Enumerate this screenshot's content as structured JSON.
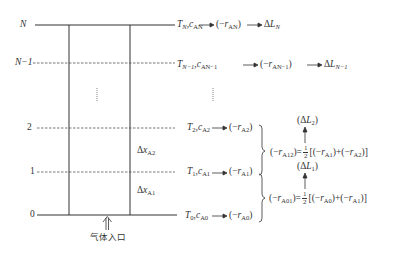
{
  "diagram": {
    "type": "reactor-segmentation-scheme",
    "levels": [
      {
        "id": "N",
        "label": "N",
        "line": "solid",
        "state": "T_N, c_AN",
        "rate": "(−r_AN)",
        "result": "ΔL_N"
      },
      {
        "id": "N-1",
        "label": "N−1",
        "line": "dashed",
        "state": "T_{N−1}, c_{AN−1}",
        "rate": "(−r_{AN−1})",
        "result": "ΔL_{N−1}"
      },
      {
        "id": "2",
        "label": "2",
        "line": "dashed",
        "state": "T_2, c_A2",
        "rate": "(−r_A2)"
      },
      {
        "id": "1",
        "label": "1",
        "line": "dashed",
        "state": "T_1, c_A1",
        "rate": "(−r_A1)"
      },
      {
        "id": "0",
        "label": "0",
        "line": "solid",
        "state": "T_0, c_A0",
        "rate": "(−r_A0)"
      }
    ],
    "segments": [
      {
        "label": "Δx_A2",
        "between": [
          "1",
          "2"
        ]
      },
      {
        "label": "Δx_A1",
        "between": [
          "0",
          "1"
        ]
      }
    ],
    "averages": [
      {
        "lhs": "(−r_A12)",
        "rhs": "½[(−r_A1)+(−r_A2)]",
        "result": "(ΔL_2)"
      },
      {
        "lhs": "(−r_A01)",
        "rhs": "½[(−r_A0)+(−r_A1)]",
        "result": "(ΔL_1)"
      }
    ],
    "inlet_label": "气体入口"
  },
  "text": {
    "lvl_N": "N",
    "lvl_N1": "N−1",
    "lvl_2": "2",
    "lvl_1": "1",
    "lvl_0": "0",
    "T": "T",
    "c": "c",
    "r": "r",
    "L": "L",
    "sub_N": "N",
    "sub_AN": "AN",
    "sub_N1": "N−1",
    "sub_AN1": "AN−1",
    "sub_2": "2",
    "sub_A2": "A2",
    "sub_1": "1",
    "sub_A1": "A1",
    "sub_0": "0",
    "sub_A0": "A0",
    "sub_A12": "A12",
    "sub_A01": "A01",
    "delta": "Δ",
    "x": "x",
    "half_num": "1",
    "half_den": "2",
    "inlet": "气体入口"
  }
}
